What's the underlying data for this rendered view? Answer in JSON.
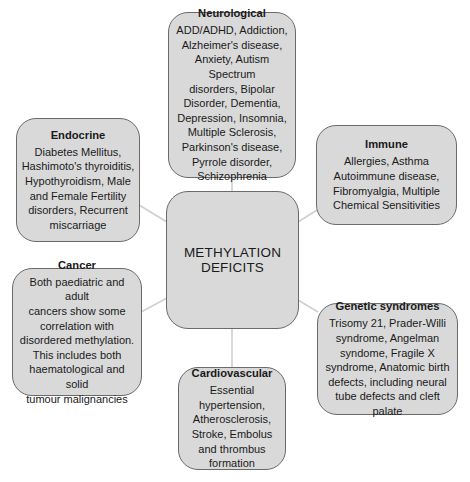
{
  "diagram": {
    "center": {
      "label": "METHYLATION\nDEFICITS"
    },
    "nodes": {
      "neurological": {
        "title": "Neurological",
        "body": "ADD/ADHD, Addiction,\nAlzheimer's disease,\nAnxiety, Autism Spectrum\ndisorders, Bipolar\nDisorder, Dementia,\nDepression, Insomnia,\nMultiple Sclerosis,\nParkinson's disease,\nPyrrole disorder,\nSchizophrenia"
      },
      "endocrine": {
        "title": "Endocrine",
        "body": "Diabetes Mellitus,\nHashimoto's thyroiditis,\nHypothyroidism, Male\nand Female Fertility\ndisorders, Recurrent\nmiscarriage"
      },
      "immune": {
        "title": "Immune",
        "body": "Allergies, Asthma\nAutoimmune disease,\nFibromyalgia, Multiple\nChemical Sensitivities"
      },
      "cancer": {
        "title": "Cancer",
        "body": "Both paediatric and adult\ncancers show some\ncorrelation with\ndisordered methylation.\nThis includes both\nhaematological and solid\ntumour malignancies"
      },
      "genetic": {
        "title": "Genetic syndromes",
        "body": "Trisomy 21, Prader-Willi\nsyndrome, Angelman\nsyndome, Fragile X\nsyndrome, Anatomic birth\ndefects, including neural\ntube defects and cleft palate"
      },
      "cardiovascular": {
        "title": "Cardiovascular",
        "body": "Essential\nhypertension,\nAtherosclerosis,\nStroke, Embolus\nand thrombus\nformation"
      }
    },
    "colors": {
      "box_fill": "#d9d9d9",
      "box_border": "#6a6a6a",
      "connector": "#d0d0d0",
      "text": "#1a1a1a"
    }
  }
}
